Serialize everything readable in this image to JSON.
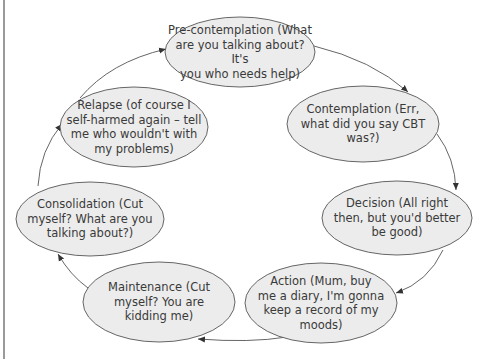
{
  "diagram": {
    "type": "cycle",
    "colors": {
      "node_fill": "#ececec",
      "node_stroke": "#555555",
      "arrow": "#555555",
      "text": "#3a3a3a",
      "left_border": "#9a9a9a"
    },
    "nodes": [
      {
        "id": "pre-contemplation",
        "label": "Pre-contemplation (What\nare you talking about? It's\nyou who needs help)",
        "cx": 240,
        "cy": 52,
        "rx": 75,
        "ry": 35
      },
      {
        "id": "contemplation",
        "label": "Contemplation (Err,\nwhat did you say CBT\nwas?)",
        "cx": 363,
        "cy": 124,
        "rx": 76,
        "ry": 38
      },
      {
        "id": "decision",
        "label": "Decision (All right\nthen, but you'd better\nbe good)",
        "cx": 397,
        "cy": 218,
        "rx": 75,
        "ry": 37
      },
      {
        "id": "action",
        "label": "Action (Mum, buy\nme a diary, I'm gonna\nkeep a record of my\nmoods)",
        "cx": 321,
        "cy": 303,
        "rx": 76,
        "ry": 40
      },
      {
        "id": "maintenance",
        "label": "Maintenance (Cut\nmyself? You are\nkidding me)",
        "cx": 159,
        "cy": 302,
        "rx": 76,
        "ry": 40
      },
      {
        "id": "consolidation",
        "label": "Consolidation (Cut\nmyself? What are you\ntalking about?)",
        "cx": 90,
        "cy": 219,
        "rx": 74,
        "ry": 37
      },
      {
        "id": "relapse",
        "label": "Relapse (of course I\nself-harmed again – tell\nme who wouldn't with\nmy problems)",
        "cx": 134,
        "cy": 127,
        "rx": 74,
        "ry": 40
      }
    ],
    "edges": [
      {
        "from": "pre-contemplation",
        "to": "contemplation"
      },
      {
        "from": "contemplation",
        "to": "decision"
      },
      {
        "from": "decision",
        "to": "action"
      },
      {
        "from": "action",
        "to": "maintenance"
      },
      {
        "from": "maintenance",
        "to": "consolidation"
      },
      {
        "from": "consolidation",
        "to": "relapse"
      },
      {
        "from": "relapse",
        "to": "pre-contemplation"
      }
    ]
  }
}
